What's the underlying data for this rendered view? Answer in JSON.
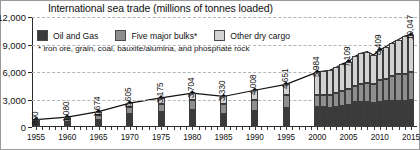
{
  "chart_data": {
    "type": "bar",
    "title": "International sea trade (millions of tonnes loaded)",
    "subtitle": "* iron ore, grain, coal, bauxite/alumina, and phosphate rock",
    "xlabel": "",
    "ylabel": "",
    "ylim": [
      0,
      12000
    ],
    "yticks": [
      0,
      3000,
      6000,
      9000,
      12000
    ],
    "ytick_labels": [
      "0",
      "3,000",
      "6,000",
      "9,000",
      "12,000"
    ],
    "xlim": [
      1955,
      2015
    ],
    "xtick_labels": [
      "1955",
      "1960",
      "1965",
      "1970",
      "1975",
      "1980",
      "1985",
      "1990",
      "1995",
      "2000",
      "2005",
      "2010",
      "2015"
    ],
    "grid": true,
    "legend_position": "top-left",
    "legend": [
      {
        "label": "Oil and Gas",
        "color": "#3a3a3a"
      },
      {
        "label": "Five major bulks*",
        "color": "#8e8e8e"
      },
      {
        "label": "Other dry cargo",
        "color": "#d2d2d2"
      }
    ],
    "categories": [
      1955,
      1960,
      1965,
      1970,
      1975,
      1980,
      1985,
      1990,
      1995,
      2000,
      2001,
      2002,
      2003,
      2004,
      2005,
      2006,
      2007,
      2008,
      2009,
      2010,
      2011,
      2012,
      2013,
      2014,
      2015
    ],
    "series": [
      {
        "name": "Oil and Gas",
        "values": [
          440,
          540,
          810,
          1440,
          1640,
          1871,
          1459,
          1755,
          2050,
          2163,
          2177,
          2122,
          2223,
          2318,
          2422,
          2698,
          2747,
          2742,
          2642,
          2772,
          2794,
          2841,
          2829,
          2825,
          2932
        ]
      },
      {
        "name": "Five major bulks*",
        "values": [
          250,
          320,
          500,
          720,
          880,
          1125,
          1015,
          1245,
          1405,
          1295,
          1331,
          1352,
          1475,
          1602,
          1709,
          1814,
          1953,
          2065,
          2085,
          2335,
          2477,
          2742,
          2923,
          2985,
          3121
        ]
      },
      {
        "name": "Other dry cargo",
        "values": [
          110,
          220,
          364,
          445,
          655,
          708,
          856,
          1008,
          1196,
          2526,
          2600,
          2700,
          2800,
          2970,
          2978,
          3188,
          3334,
          3422,
          3131,
          3302,
          3505,
          3614,
          3784,
          4120,
          3994
        ]
      }
    ],
    "totals": [
      800,
      1080,
      1674,
      2605,
      3175,
      3704,
      3330,
      4008,
      4651,
      5984,
      6108,
      6174,
      6498,
      6890,
      7109,
      7700,
      8034,
      8229,
      7858,
      8409,
      8776,
      9197,
      9536,
      9930,
      10047
    ],
    "data_labels": [
      {
        "x": 1955,
        "value": 800,
        "text": "800"
      },
      {
        "x": 1960,
        "value": 1080,
        "text": "1,080"
      },
      {
        "x": 1965,
        "value": 1674,
        "text": "1,674"
      },
      {
        "x": 1970,
        "value": 2605,
        "text": "2,605"
      },
      {
        "x": 1975,
        "value": 3175,
        "text": "3,175"
      },
      {
        "x": 1980,
        "value": 3704,
        "text": "3,704"
      },
      {
        "x": 1985,
        "value": 3330,
        "text": "3,330"
      },
      {
        "x": 1990,
        "value": 4008,
        "text": "4,008"
      },
      {
        "x": 1995,
        "value": 4651,
        "text": "4,651"
      },
      {
        "x": 2000,
        "value": 5984,
        "text": "5,984"
      },
      {
        "x": 2005,
        "value": 7109,
        "text": "7,109"
      },
      {
        "x": 2010,
        "value": 8409,
        "text": "8,409"
      },
      {
        "x": 2015,
        "value": 10047,
        "text": "10,047"
      }
    ],
    "trend_line": {
      "name": "Total sea trade",
      "color": "#111111",
      "marker": "diamond"
    }
  }
}
